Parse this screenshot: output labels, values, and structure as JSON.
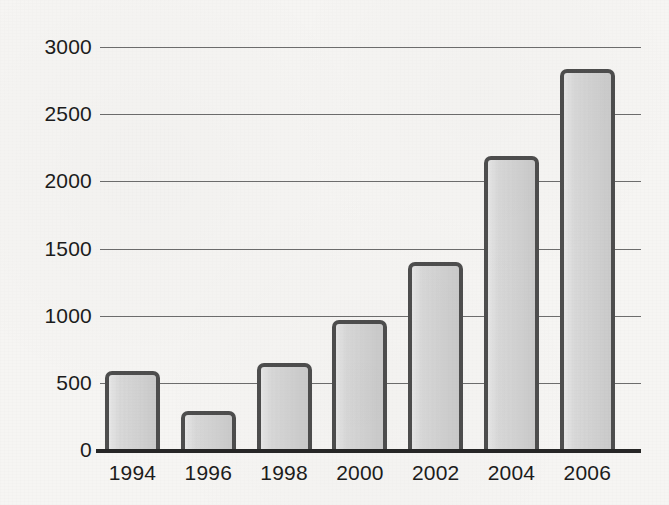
{
  "chart_data": {
    "type": "bar",
    "title": "",
    "subtitle": "",
    "xlabel": "",
    "ylabel": "",
    "categories": [
      "1994",
      "1996",
      "1998",
      "2000",
      "2002",
      "2004",
      "2006"
    ],
    "values": [
      590,
      290,
      650,
      970,
      1400,
      2190,
      2840
    ],
    "series": [
      {
        "name": "",
        "values": [
          590,
          290,
          650,
          970,
          1400,
          2190,
          2840
        ]
      }
    ],
    "ylim": [
      0,
      3000
    ],
    "yticks": [
      0,
      500,
      1000,
      1500,
      2000,
      2500,
      3000
    ],
    "ytick_labels": [
      "0",
      "500",
      "1000",
      "1500",
      "2000",
      "2500",
      "3000"
    ],
    "xtick_labels": [
      "1994",
      "1996",
      "1998",
      "2000",
      "2002",
      "2004",
      "2006"
    ],
    "grid": "horizontal",
    "legend": "none",
    "annotations": [],
    "colors": {
      "background": "#f6f5f3",
      "bar_fill": "#d3d3d3",
      "bar_stroke": "#4e4e4e",
      "gridline": "#6d6d6d",
      "axis": "#262626",
      "text": "#1c1c1c"
    }
  }
}
